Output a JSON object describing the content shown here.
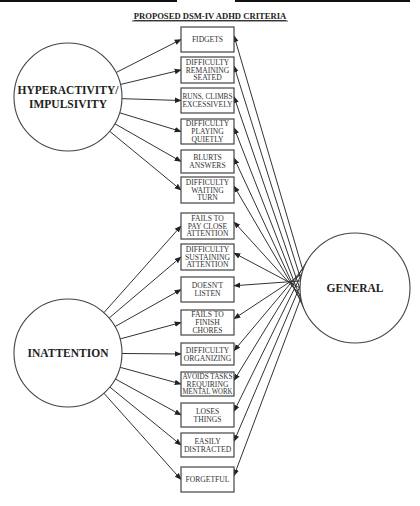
{
  "title": "PROPOSED DSM-IV ADHD CRITERIA",
  "colors": {
    "stroke": "#444444",
    "text": "#222222",
    "background": "#ffffff"
  },
  "top_bars": [
    {
      "x1": 0,
      "x2": 177
    },
    {
      "x1": 235,
      "x2": 410
    }
  ],
  "nodes": {
    "hyperactivity": {
      "label_lines": [
        "HYPERACTIVITY/",
        "IMPULSIVITY"
      ],
      "cx": 68,
      "cy": 97,
      "r": 54
    },
    "inattention": {
      "label_lines": [
        "INATTENTION"
      ],
      "cx": 68,
      "cy": 353,
      "r": 54
    },
    "general": {
      "label_lines": [
        "GENERAL"
      ],
      "cx": 355,
      "cy": 288,
      "r": 55
    }
  },
  "criteria_box": {
    "x": 181,
    "width": 53
  },
  "criteria": [
    {
      "group": "hyperactivity",
      "lines": [
        "FIDGETS"
      ],
      "y": 27,
      "h": 25
    },
    {
      "group": "hyperactivity",
      "lines": [
        "DIFFICULTY",
        "REMAINING",
        "SEATED"
      ],
      "y": 57,
      "h": 26
    },
    {
      "group": "hyperactivity",
      "lines": [
        "RUNS, CLIMBS",
        "EXCESSIVELY"
      ],
      "y": 88,
      "h": 25
    },
    {
      "group": "hyperactivity",
      "lines": [
        "DIFFICULTY",
        "PLAYING",
        "QUIETLY"
      ],
      "y": 119,
      "h": 25
    },
    {
      "group": "hyperactivity",
      "lines": [
        "BLURTS",
        "ANSWERS"
      ],
      "y": 150,
      "h": 23
    },
    {
      "group": "hyperactivity",
      "lines": [
        "DIFFICULTY",
        "WAITING",
        "TURN"
      ],
      "y": 177,
      "h": 26
    },
    {
      "group": "inattention",
      "lines": [
        "FAILS TO",
        "PAY CLOSE",
        "ATTENTION"
      ],
      "y": 213,
      "h": 26
    },
    {
      "group": "inattention",
      "lines": [
        "DIFFICULTY",
        "SUSTAINING",
        "ATTENTION"
      ],
      "y": 244,
      "h": 26
    },
    {
      "group": "inattention",
      "lines": [
        "DOESN'T",
        "LISTEN"
      ],
      "y": 277,
      "h": 25
    },
    {
      "group": "inattention",
      "lines": [
        "FAILS TO",
        "FINISH",
        "CHORES"
      ],
      "y": 310,
      "h": 25
    },
    {
      "group": "inattention",
      "lines": [
        "DIFFICULTY",
        "ORGANIZING"
      ],
      "y": 343,
      "h": 22
    },
    {
      "group": "inattention",
      "lines": [
        "AVOIDS TASKS",
        "REQUIRING",
        "MENTAL WORK"
      ],
      "y": 372,
      "h": 24
    },
    {
      "group": "inattention",
      "lines": [
        "LOSES",
        "THINGS"
      ],
      "y": 403,
      "h": 24
    },
    {
      "group": "inattention",
      "lines": [
        "EASILY",
        "DISTRACTED"
      ],
      "y": 433,
      "h": 24
    },
    {
      "group": "inattention",
      "lines": [
        "FORGETFUL"
      ],
      "y": 467,
      "h": 25
    }
  ],
  "edges_note": "Arrows from group circle to each criterion's left edge; arrows from GENERAL to each criterion's right edge"
}
